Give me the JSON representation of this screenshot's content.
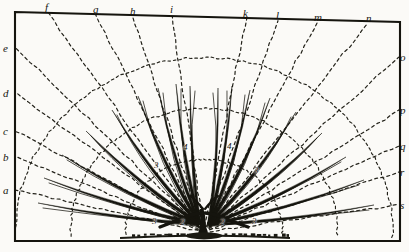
{
  "figure": {
    "ink_color": "#15140e",
    "paper_color": "#fbfaf7",
    "dash_color": "#23221a"
  },
  "frame": {
    "top_left": [
      15,
      12
    ],
    "top_right": [
      400,
      22
    ],
    "bottom_left": [
      15,
      241
    ],
    "bottom_right": [
      400,
      241
    ]
  },
  "origin": {
    "x": 204,
    "y": 232
  },
  "top_labels": [
    {
      "text": "f",
      "x": 45,
      "y": 2
    },
    {
      "text": "g",
      "x": 93,
      "y": 4
    },
    {
      "text": "h",
      "x": 130,
      "y": 6
    },
    {
      "text": "i",
      "x": 170,
      "y": 4
    },
    {
      "text": "k",
      "x": 243,
      "y": 8
    },
    {
      "text": "l",
      "x": 276,
      "y": 10
    },
    {
      "text": "m",
      "x": 314,
      "y": 12
    },
    {
      "text": "n",
      "x": 366,
      "y": 13
    }
  ],
  "left_labels": [
    {
      "text": "e",
      "x": 3,
      "y": 43
    },
    {
      "text": "d",
      "x": 3,
      "y": 88
    },
    {
      "text": "c",
      "x": 3,
      "y": 126
    },
    {
      "text": "b",
      "x": 3,
      "y": 152
    },
    {
      "text": "a",
      "x": 3,
      "y": 185
    }
  ],
  "right_labels": [
    {
      "text": "o",
      "x": 400,
      "y": 52
    },
    {
      "text": "p",
      "x": 400,
      "y": 105
    },
    {
      "text": "q",
      "x": 400,
      "y": 141
    },
    {
      "text": "r",
      "x": 400,
      "y": 167
    },
    {
      "text": "s",
      "x": 400,
      "y": 200
    }
  ],
  "branch_order_labels": [
    {
      "text": "3",
      "x": 154,
      "y": 161
    },
    {
      "text": "4",
      "x": 183,
      "y": 143
    },
    {
      "text": "4",
      "x": 227,
      "y": 142
    },
    {
      "text": "3",
      "x": 254,
      "y": 166
    },
    {
      "text": "3",
      "x": 152,
      "y": 217
    },
    {
      "text": "2",
      "x": 180,
      "y": 218
    },
    {
      "text": "2",
      "x": 220,
      "y": 218
    },
    {
      "text": "3",
      "x": 252,
      "y": 217
    }
  ],
  "radial_spokes": [
    {
      "id": "spoke-a",
      "end_x": 16,
      "end_y": 190
    },
    {
      "id": "spoke-b",
      "end_x": 16,
      "end_y": 157
    },
    {
      "id": "spoke-c",
      "end_x": 16,
      "end_y": 131
    },
    {
      "id": "spoke-d",
      "end_x": 16,
      "end_y": 93
    },
    {
      "id": "spoke-e",
      "end_x": 16,
      "end_y": 48
    },
    {
      "id": "spoke-f",
      "end_x": 48,
      "end_y": 13
    },
    {
      "id": "spoke-g",
      "end_x": 96,
      "end_y": 15
    },
    {
      "id": "spoke-h",
      "end_x": 133,
      "end_y": 16
    },
    {
      "id": "spoke-i",
      "end_x": 172,
      "end_y": 16
    },
    {
      "id": "spoke-k",
      "end_x": 246,
      "end_y": 19
    },
    {
      "id": "spoke-l",
      "end_x": 278,
      "end_y": 20
    },
    {
      "id": "spoke-m",
      "end_x": 318,
      "end_y": 21
    },
    {
      "id": "spoke-n",
      "end_x": 368,
      "end_y": 22
    },
    {
      "id": "spoke-o",
      "end_x": 399,
      "end_y": 57
    },
    {
      "id": "spoke-p",
      "end_x": 399,
      "end_y": 110
    },
    {
      "id": "spoke-q",
      "end_x": 399,
      "end_y": 146
    },
    {
      "id": "spoke-r",
      "end_x": 399,
      "end_y": 172
    },
    {
      "id": "spoke-s",
      "end_x": 399,
      "end_y": 205
    }
  ],
  "arcs": [
    {
      "id": "arc-outer",
      "radius": 178
    },
    {
      "id": "arc-middle",
      "radius": 126
    },
    {
      "id": "arc-inner",
      "radius": 74
    }
  ],
  "branches": [
    {
      "id": "branch-l1",
      "tip_x": 38,
      "tip_y": 203,
      "spread": 2.0,
      "width": 3.0
    },
    {
      "id": "branch-l2",
      "tip_x": 44,
      "tip_y": 178,
      "spread": 2.4,
      "width": 3.4
    },
    {
      "id": "branch-l3",
      "tip_x": 62,
      "tip_y": 155,
      "spread": 2.6,
      "width": 3.6
    },
    {
      "id": "branch-l4",
      "tip_x": 86,
      "tip_y": 131,
      "spread": 2.8,
      "width": 3.8
    },
    {
      "id": "branch-l5",
      "tip_x": 112,
      "tip_y": 110,
      "spread": 2.8,
      "width": 3.8
    },
    {
      "id": "branch-l6",
      "tip_x": 138,
      "tip_y": 96,
      "spread": 2.6,
      "width": 3.6
    },
    {
      "id": "branch-l7",
      "tip_x": 158,
      "tip_y": 88,
      "spread": 2.4,
      "width": 3.4
    },
    {
      "id": "branch-l8",
      "tip_x": 176,
      "tip_y": 84,
      "spread": 2.0,
      "width": 3.2
    },
    {
      "id": "branch-l9",
      "tip_x": 190,
      "tip_y": 86,
      "spread": 1.6,
      "width": 2.8
    },
    {
      "id": "branch-r1",
      "tip_x": 374,
      "tip_y": 205,
      "spread": 2.0,
      "width": 3.0
    },
    {
      "id": "branch-r2",
      "tip_x": 364,
      "tip_y": 180,
      "spread": 2.4,
      "width": 3.4
    },
    {
      "id": "branch-r3",
      "tip_x": 346,
      "tip_y": 157,
      "spread": 2.6,
      "width": 3.6
    },
    {
      "id": "branch-r4",
      "tip_x": 322,
      "tip_y": 133,
      "spread": 2.8,
      "width": 3.8
    },
    {
      "id": "branch-r5",
      "tip_x": 296,
      "tip_y": 112,
      "spread": 2.8,
      "width": 3.8
    },
    {
      "id": "branch-r6",
      "tip_x": 270,
      "tip_y": 98,
      "spread": 2.6,
      "width": 3.6
    },
    {
      "id": "branch-r7",
      "tip_x": 250,
      "tip_y": 90,
      "spread": 2.4,
      "width": 3.4
    },
    {
      "id": "branch-r8",
      "tip_x": 232,
      "tip_y": 86,
      "spread": 2.0,
      "width": 3.2
    },
    {
      "id": "branch-r9",
      "tip_x": 218,
      "tip_y": 88,
      "spread": 1.6,
      "width": 2.8
    }
  ],
  "ground": {
    "y": 238,
    "left_x": 120,
    "right_x": 290,
    "mound_color": "#1b1a13"
  }
}
